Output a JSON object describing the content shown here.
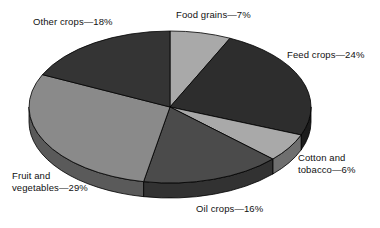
{
  "chart_data": {
    "type": "pie",
    "title": "",
    "subtitle": "",
    "xlabel": "",
    "ylabel": "",
    "legend_position": "none",
    "grid": false,
    "style": "3d-exploded-ellipse",
    "units": "percent",
    "total": 100,
    "start_angle_deg": 0,
    "direction": "clockwise",
    "categories": [
      "Food grains",
      "Feed crops",
      "Cotton and tobacco",
      "Oil crops",
      "Fruit and vegetables",
      "Other crops"
    ],
    "values": [
      7,
      24,
      6,
      16,
      29,
      18
    ],
    "slices": [
      {
        "name": "Food grains",
        "value": 7,
        "value_text": "7%",
        "label": "Food grains—7%",
        "color": "#a9a9a9",
        "side_color": "#6f6f6f",
        "start_deg": 0,
        "end_deg": 25.2
      },
      {
        "name": "Feed crops",
        "value": 24,
        "value_text": "24%",
        "label": "Feed crops—24%",
        "color": "#2d2d2d",
        "side_color": "#1c1c1c",
        "start_deg": 25.2,
        "end_deg": 111.6
      },
      {
        "name": "Cotton and tobacco",
        "value": 6,
        "value_text": "6%",
        "label": "Cotton and\ntobacco—6%",
        "color": "#a9a9a9",
        "side_color": "#6f6f6f",
        "start_deg": 111.6,
        "end_deg": 133.2
      },
      {
        "name": "Oil crops",
        "value": 16,
        "value_text": "16%",
        "label": "Oil crops—16%",
        "color": "#4b4b4b",
        "side_color": "#323232",
        "start_deg": 133.2,
        "end_deg": 190.8
      },
      {
        "name": "Fruit and vegetables",
        "value": 29,
        "value_text": "29%",
        "label": "Fruit and\nvegetables—29%",
        "color": "#8a8a8a",
        "side_color": "#5a5a5a",
        "start_deg": 190.8,
        "end_deg": 295.2
      },
      {
        "name": "Other crops",
        "value": 18,
        "value_text": "18%",
        "label": "Other crops—18%",
        "color": "#343434",
        "side_color": "#222222",
        "start_deg": 295.2,
        "end_deg": 360
      }
    ]
  },
  "labels": {
    "other_crops": "Other crops—18%",
    "food_grains": "Food grains—7%",
    "feed_crops": "Feed crops—24%",
    "cotton_tobacco_line1": "Cotton and",
    "cotton_tobacco_line2": "tobacco—6%",
    "oil_crops": "Oil crops—16%",
    "fruit_veg_line1": "Fruit and",
    "fruit_veg_line2": "vegetables—29%"
  },
  "colors": {
    "background": "#ffffff",
    "text": "#111111",
    "outline": "#000000"
  }
}
